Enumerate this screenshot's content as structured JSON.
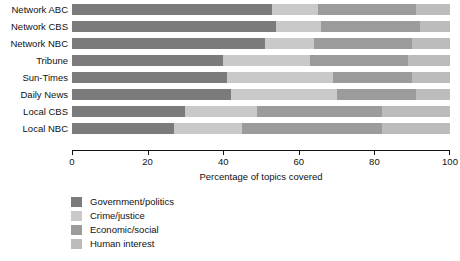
{
  "chart_data": {
    "type": "bar",
    "orientation": "horizontal",
    "stacked": true,
    "title": "",
    "xlabel": "Percentage of topics covered",
    "ylabel": "",
    "xlim": [
      0,
      100
    ],
    "xticks": [
      0,
      20,
      40,
      60,
      80,
      100
    ],
    "xtick_labels": [
      "0",
      "20",
      "40",
      "60",
      "80",
      "100"
    ],
    "grid": false,
    "legend_position": "below-left",
    "categories": [
      "Network ABC",
      "Network CBS",
      "Network NBC",
      "Tribune",
      "Sun-Times",
      "Daily News",
      "Local CBS",
      "Local NBC"
    ],
    "series": [
      {
        "name": "Government/politics",
        "color": "#7b7b7b",
        "values": [
          53,
          54,
          51,
          40,
          41,
          42,
          30,
          27
        ]
      },
      {
        "name": "Crime/justice",
        "color": "#c9c9c9",
        "values": [
          12,
          12,
          13,
          23,
          28,
          28,
          19,
          18
        ]
      },
      {
        "name": "Economic/social",
        "color": "#9b9b9b",
        "values": [
          26,
          26,
          26,
          26,
          21,
          21,
          33,
          37
        ]
      },
      {
        "name": "Human interest",
        "color": "#bcbcbc",
        "values": [
          9,
          8,
          10,
          11,
          10,
          9,
          18,
          18
        ]
      }
    ]
  },
  "colors": {
    "axis": "#111111",
    "text": "#111111",
    "background": "#ffffff"
  }
}
